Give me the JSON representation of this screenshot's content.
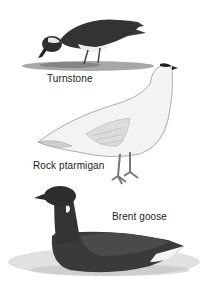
{
  "illustration": {
    "birds": [
      {
        "name": "turnstone",
        "label": "Turnstone"
      },
      {
        "name": "rock-ptarmigan",
        "label": "Rock ptarmigan"
      },
      {
        "name": "brent-goose",
        "label": "Brent goose"
      }
    ]
  },
  "colors": {
    "background": "#ffffff",
    "label_text": "#222222",
    "dark_plumage": "#2e2e2e",
    "white_plumage": "#f2f2f2",
    "ground": "#8a8a8a",
    "water": "#d9d9d9"
  }
}
